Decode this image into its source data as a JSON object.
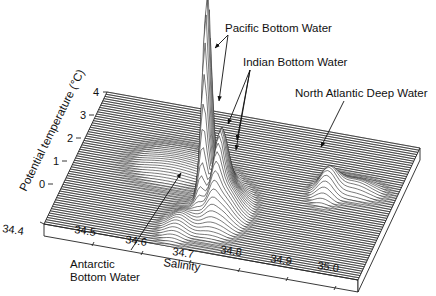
{
  "chart_data": {
    "type": "surface-3d",
    "title": "",
    "xlabel": "Salinity",
    "ylabel": "Potential temperature (°C)",
    "x_ticks": [
      "34.4",
      "34.5",
      "34.6",
      "34.7",
      "34.8",
      "34.9",
      "35.0"
    ],
    "y_ticks": [
      "0",
      "1",
      "2",
      "3",
      "4"
    ],
    "xlim": [
      34.4,
      35.05
    ],
    "ylim": [
      -1,
      4
    ],
    "z_description": "Relative volume of water (waterfall/ridge-line surface); no z-axis labels shown",
    "peaks": [
      {
        "name": "Pacific Bottom Water",
        "salinity": 34.68,
        "temperature": 1.2,
        "height": "very high"
      },
      {
        "name": "Indian Bottom Water",
        "salinity": 34.72,
        "temperature": 0.9,
        "height": "high"
      },
      {
        "name": "North Atlantic Deep Water",
        "salinity": 34.92,
        "temperature": 2.4,
        "height": "moderate"
      },
      {
        "name": "Antarctic Bottom Water",
        "salinity": 34.66,
        "temperature": -0.5,
        "height": "low"
      }
    ],
    "annotations": [
      "Pacific Bottom Water",
      "Indian Bottom Water",
      "North Atlantic Deep Water",
      "Antarctic Bottom Water"
    ],
    "grid": false,
    "legend": "none"
  },
  "labels": {
    "ylabel": "Potential temperature (°C)",
    "xlabel": "Salinity",
    "pacific": "Pacific Bottom Water",
    "indian": "Indian Bottom Water",
    "nadw": "North Atlantic Deep Water",
    "antarctic_1": "Antarctic",
    "antarctic_2": "Bottom Water"
  },
  "ticks": {
    "y": [
      "0",
      "1",
      "2",
      "3",
      "4"
    ],
    "x": [
      "34.4",
      "34.5",
      "34.6",
      "34.7",
      "34.8",
      "34.9",
      "35.0"
    ]
  }
}
